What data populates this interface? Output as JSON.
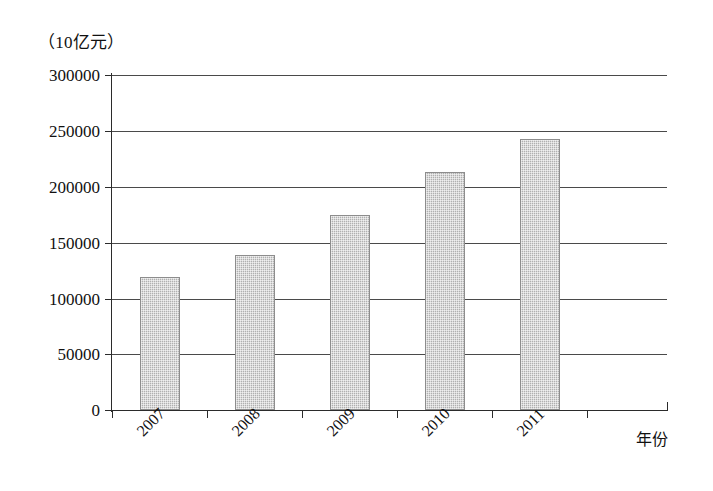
{
  "chart_data": {
    "type": "bar",
    "title": "",
    "subtitle": "",
    "xlabel": "年份",
    "ylabel": "（10亿元）",
    "categories": [
      "2007",
      "2008",
      "2009",
      "2010",
      "2011"
    ],
    "values": [
      119000,
      139000,
      175000,
      213000,
      243000
    ],
    "series": [
      {
        "name": "",
        "values": [
          119000,
          139000,
          175000,
          213000,
          243000
        ]
      }
    ],
    "ylim": [
      0,
      300000
    ],
    "yticks": [
      0,
      50000,
      100000,
      150000,
      200000,
      250000,
      300000
    ],
    "ytick_labels": [
      "0",
      "50000",
      "100000",
      "150000",
      "200000",
      "250000",
      "300000"
    ],
    "grid": true,
    "grid_axis": "y",
    "legend": false,
    "legend_position": "none",
    "bar_color": "#b0b0b0",
    "bar_edge_color": "#8d8d8d",
    "axis_color": "#2b2b2b",
    "gridline_color": "#4a4a4a",
    "background_color": "#ffffff",
    "xtick_label_rotation": -45,
    "annotations": []
  },
  "axes": {
    "y_unit_caption": "（10亿元）",
    "x_axis_title": "年份"
  }
}
